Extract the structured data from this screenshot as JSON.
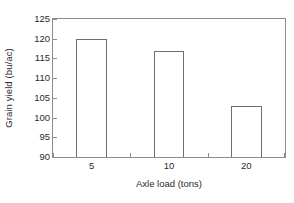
{
  "chart_data": {
    "type": "bar",
    "title": "",
    "subtitle": "",
    "xlabel": "Axle load (tons)",
    "ylabel": "Grain yield (bu/ac)",
    "categories": [
      "5",
      "10",
      "20"
    ],
    "values": [
      120,
      117,
      103
    ],
    "series": [
      {
        "name": "Grain yield",
        "values": [
          120,
          117,
          103
        ]
      }
    ],
    "ylim": [
      90,
      125
    ],
    "yticks": [
      90,
      95,
      100,
      105,
      110,
      115,
      120,
      125
    ],
    "ytick_labels": [
      "90",
      "95",
      "100",
      "105",
      "110",
      "115",
      "120",
      "125"
    ],
    "xtick_labels": [
      "5",
      "10",
      "20"
    ],
    "grid": false,
    "legend": null,
    "legend_position": "none",
    "annotations": [],
    "bar_fill_color": "#ffffff",
    "bar_edge_color": "#6f6f6f",
    "axis_color": "#8c8c8c",
    "text_color": "#2b2b2b",
    "background_color": "#ffffff",
    "frame": "box"
  }
}
